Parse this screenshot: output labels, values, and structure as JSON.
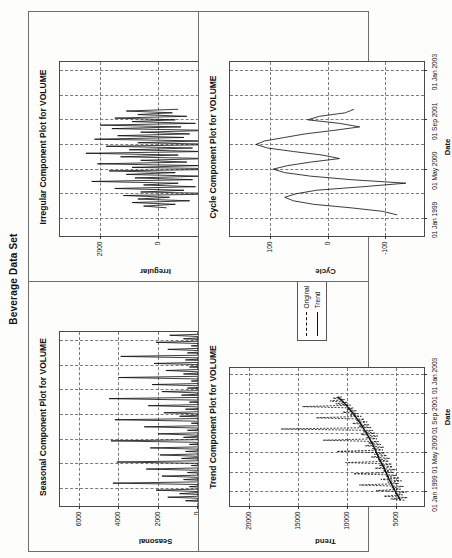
{
  "figure": {
    "title": "Beverage Data Set"
  },
  "panels": [
    {
      "id": "seasonal",
      "title": "Seasonal Component Plot for VOLUME",
      "xlabel": "Date",
      "ylabel": "Seasonal"
    },
    {
      "id": "irregular",
      "title": "Irregular Component Plot for VOLUME",
      "xlabel": "Date",
      "ylabel": "Irregular"
    },
    {
      "id": "trend",
      "title": "Trend Component Plot for VOLUME",
      "xlabel": "Date",
      "ylabel": "Trend"
    },
    {
      "id": "cycle",
      "title": "Cycle Component Plot for VOLUME",
      "xlabel": "Date",
      "ylabel": "Cycle"
    }
  ],
  "legend": {
    "items": [
      {
        "label": "Original",
        "style": "dashed"
      },
      {
        "label": "Trend",
        "style": "solid"
      }
    ]
  },
  "chart_data": [
    {
      "type": "line",
      "id": "seasonal",
      "title": "Seasonal Component Plot for VOLUME",
      "xlabel": "Date",
      "ylabel": "Seasonal",
      "grid": true,
      "legend": "none",
      "xticks": [
        "01 Jan 1999",
        "01 May 2000",
        "01 Sep 2001",
        "01 Jan 2003"
      ],
      "xtick_pos": [
        0.1,
        0.38,
        0.66,
        0.94
      ],
      "yticks": [
        6000,
        4000,
        2000,
        0,
        -2000
      ],
      "ylim": [
        -3000,
        7000
      ],
      "xlim": [
        0,
        1
      ],
      "series": [
        {
          "name": "Seasonal",
          "x": [
            0.02,
            0.03,
            0.04,
            0.05,
            0.06,
            0.07,
            0.08,
            0.09,
            0.1,
            0.11,
            0.12,
            0.13,
            0.14,
            0.15,
            0.16,
            0.17,
            0.18,
            0.19,
            0.2,
            0.21,
            0.22,
            0.23,
            0.24,
            0.25,
            0.26,
            0.27,
            0.28,
            0.29,
            0.3,
            0.31,
            0.32,
            0.33,
            0.34,
            0.35,
            0.36,
            0.37,
            0.38,
            0.39,
            0.4,
            0.41,
            0.42,
            0.43,
            0.44,
            0.45,
            0.46,
            0.47,
            0.48,
            0.49,
            0.5,
            0.51,
            0.52,
            0.53,
            0.54,
            0.55,
            0.56,
            0.57,
            0.58,
            0.59,
            0.6,
            0.61,
            0.62,
            0.63,
            0.64,
            0.65,
            0.66,
            0.67,
            0.68,
            0.69,
            0.7,
            0.71,
            0.72,
            0.73,
            0.74,
            0.75,
            0.76,
            0.77,
            0.78,
            0.79,
            0.8,
            0.81,
            0.82,
            0.83,
            0.84,
            0.85,
            0.86,
            0.87,
            0.88,
            0.89,
            0.9,
            0.91,
            0.92,
            0.93,
            0.94,
            0.95,
            0.96,
            0.97,
            0.98
          ],
          "y": [
            -900,
            600,
            -1100,
            1500,
            -1400,
            900,
            -600,
            2100,
            -1500,
            400,
            -1200,
            4300,
            -1900,
            700,
            -800,
            1800,
            -1600,
            500,
            -1000,
            2600,
            -1700,
            300,
            -1300,
            4100,
            -2000,
            800,
            -700,
            1900,
            -1500,
            600,
            -1100,
            2400,
            -1800,
            400,
            -900,
            4400,
            -2100,
            700,
            -600,
            2000,
            -1600,
            500,
            -1200,
            2700,
            -1900,
            300,
            -1000,
            4200,
            -2000,
            900,
            -800,
            1700,
            -1400,
            600,
            -1300,
            2500,
            -1700,
            400,
            -900,
            4500,
            -2100,
            800,
            -700,
            1800,
            -1500,
            500,
            -1100,
            2300,
            -1800,
            300,
            -1000,
            4000,
            -1900,
            700,
            -600,
            1600,
            -1400,
            400,
            -1200,
            2200,
            -1600,
            600,
            -900,
            3900,
            -2000,
            500,
            -800,
            1500,
            -1300,
            300,
            -1100,
            2100,
            -1500,
            700,
            -700,
            1400,
            -1200
          ]
        }
      ]
    },
    {
      "type": "line",
      "id": "irregular",
      "title": "Irregular Component Plot for VOLUME",
      "xlabel": "Date",
      "ylabel": "Irregular",
      "grid": true,
      "legend": "none",
      "xticks": [
        "01 Jan 1999",
        "01 May 2000",
        "01 Sep 2001",
        "01 Jan 2003"
      ],
      "xtick_pos": [
        0.1,
        0.38,
        0.66,
        0.94
      ],
      "yticks": [
        2000,
        0,
        -2000
      ],
      "ylim": [
        -3400,
        3400
      ],
      "xlim": [
        0,
        1
      ],
      "series": [
        {
          "name": "Irregular",
          "x": [
            0.16,
            0.17,
            0.18,
            0.19,
            0.2,
            0.21,
            0.22,
            0.23,
            0.24,
            0.25,
            0.26,
            0.27,
            0.28,
            0.29,
            0.3,
            0.31,
            0.32,
            0.33,
            0.34,
            0.35,
            0.36,
            0.37,
            0.38,
            0.39,
            0.4,
            0.41,
            0.42,
            0.43,
            0.44,
            0.45,
            0.46,
            0.47,
            0.48,
            0.49,
            0.5,
            0.51,
            0.52,
            0.53,
            0.54,
            0.55,
            0.56,
            0.57,
            0.58,
            0.59,
            0.6,
            0.61,
            0.62,
            0.63,
            0.64,
            0.65,
            0.66,
            0.67,
            0.68,
            0.69,
            0.7,
            0.71,
            0.72
          ],
          "y": [
            -300,
            500,
            -600,
            900,
            -1100,
            700,
            -400,
            1200,
            -2600,
            600,
            -900,
            1500,
            -1300,
            500,
            -700,
            2300,
            -1200,
            800,
            -1500,
            1100,
            -600,
            1700,
            -2900,
            900,
            -1400,
            2100,
            -1000,
            600,
            -1800,
            1300,
            -700,
            2500,
            -1600,
            1000,
            -1200,
            1800,
            -2400,
            700,
            -1500,
            2200,
            -900,
            1400,
            -1100,
            600,
            -1900,
            1600,
            -800,
            2000,
            -1300,
            900,
            -600,
            1500,
            -1000,
            700,
            -500,
            1100,
            -700
          ]
        }
      ]
    },
    {
      "type": "line",
      "id": "trend",
      "title": "Trend Component Plot for VOLUME",
      "xlabel": "Date",
      "ylabel": "Trend",
      "grid": true,
      "legend": "inside-right",
      "xticks": [
        "01 Jan 1999",
        "01 May 2000",
        "01 Sep 2001",
        "01 Jan 2003"
      ],
      "xtick_pos": [
        0.1,
        0.38,
        0.66,
        0.94
      ],
      "yticks": [
        20000,
        15000,
        10000,
        5000
      ],
      "ylim": [
        2000,
        22000
      ],
      "xlim": [
        0,
        1
      ],
      "series": [
        {
          "name": "Original",
          "style": "dashed",
          "x": [
            0.04,
            0.05,
            0.06,
            0.07,
            0.08,
            0.09,
            0.1,
            0.11,
            0.12,
            0.13,
            0.14,
            0.15,
            0.16,
            0.17,
            0.18,
            0.19,
            0.2,
            0.21,
            0.22,
            0.23,
            0.24,
            0.25,
            0.26,
            0.27,
            0.28,
            0.29,
            0.3,
            0.31,
            0.32,
            0.33,
            0.34,
            0.35,
            0.36,
            0.37,
            0.38,
            0.39,
            0.4,
            0.41,
            0.42,
            0.43,
            0.44,
            0.45,
            0.46,
            0.47,
            0.48,
            0.49,
            0.5,
            0.51,
            0.52,
            0.53,
            0.54,
            0.55,
            0.56,
            0.57,
            0.58,
            0.59,
            0.6,
            0.61,
            0.62,
            0.63,
            0.64,
            0.65,
            0.66,
            0.67,
            0.68,
            0.69,
            0.7,
            0.71,
            0.72,
            0.73,
            0.74,
            0.75,
            0.76,
            0.77,
            0.78
          ],
          "y": [
            4200,
            5600,
            3900,
            6300,
            4400,
            5200,
            4000,
            7100,
            4600,
            5500,
            4300,
            8800,
            4800,
            5900,
            4500,
            6600,
            4700,
            6100,
            5000,
            9400,
            5300,
            6400,
            5100,
            7200,
            5400,
            6800,
            5500,
            10200,
            5800,
            6900,
            5700,
            7600,
            6000,
            7300,
            6200,
            11100,
            6400,
            7500,
            6300,
            8200,
            6600,
            7900,
            6800,
            12500,
            7000,
            8100,
            6900,
            8600,
            7200,
            8400,
            7400,
            16800,
            7600,
            8900,
            7800,
            9500,
            8000,
            9100,
            8300,
            13200,
            8600,
            9800,
            8900,
            10500,
            9100,
            10100,
            9400,
            14600,
            9700,
            11200,
            10000,
            11800,
            10300,
            11500,
            10600
          ]
        },
        {
          "name": "Trend",
          "style": "solid",
          "x": [
            0.04,
            0.1,
            0.18,
            0.26,
            0.34,
            0.42,
            0.5,
            0.58,
            0.66,
            0.74,
            0.78
          ],
          "y": [
            4600,
            5100,
            5700,
            6200,
            6800,
            7300,
            7900,
            8600,
            9400,
            10400,
            11000
          ]
        }
      ]
    },
    {
      "type": "line",
      "id": "cycle",
      "title": "Cycle Component Plot for VOLUME",
      "xlabel": "Date",
      "ylabel": "Cycle",
      "grid": true,
      "legend": "none",
      "xticks": [
        "01 Jan 1999",
        "01 May 2000",
        "01 Sep 2001",
        "01 Jan 2003"
      ],
      "xtick_pos": [
        0.1,
        0.38,
        0.66,
        0.94
      ],
      "yticks": [
        100,
        0,
        -100
      ],
      "ylim": [
        -170,
        170
      ],
      "xlim": [
        0,
        1
      ],
      "series": [
        {
          "name": "Cycle",
          "x": [
            0.12,
            0.14,
            0.16,
            0.18,
            0.2,
            0.22,
            0.24,
            0.26,
            0.28,
            0.3,
            0.32,
            0.34,
            0.36,
            0.38,
            0.4,
            0.42,
            0.44,
            0.46,
            0.48,
            0.5,
            0.52,
            0.54,
            0.56,
            0.58,
            0.6,
            0.62,
            0.64,
            0.66,
            0.68,
            0.7,
            0.72
          ],
          "y": [
            -120,
            -95,
            -40,
            25,
            60,
            75,
            55,
            20,
            -60,
            -135,
            -40,
            30,
            75,
            95,
            70,
            30,
            -20,
            10,
            60,
            105,
            125,
            110,
            75,
            40,
            -10,
            -55,
            -20,
            35,
            15,
            -30,
            -45
          ]
        }
      ]
    }
  ]
}
